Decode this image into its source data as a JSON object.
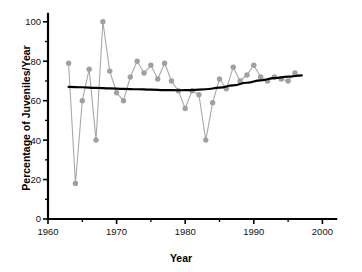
{
  "chart_data": {
    "type": "line",
    "title": "",
    "xlabel": "Year",
    "ylabel": "Percentage of Juveniles/Year",
    "xlim": [
      1960,
      2002
    ],
    "ylim": [
      0,
      104
    ],
    "xticks": [
      1960,
      1970,
      1980,
      1990,
      2000
    ],
    "xtick_labels": [
      "1960",
      "1970",
      "1980",
      "1990",
      "2000"
    ],
    "xticks_minor": [
      1965,
      1975,
      1985,
      1995
    ],
    "yticks": [
      0,
      20,
      40,
      60,
      80,
      100
    ],
    "ytick_labels": [
      "0",
      "20",
      "40",
      "60",
      "80",
      "100"
    ],
    "yticks_minor": [
      10,
      30,
      50,
      70,
      90
    ],
    "grid": false,
    "legend": "none",
    "series": [
      {
        "name": "Percentage of Juveniles",
        "marker": "circle",
        "color": "#a0a0a0",
        "x": [
          1963,
          1964,
          1965,
          1966,
          1967,
          1968,
          1969,
          1970,
          1971,
          1972,
          1973,
          1974,
          1975,
          1976,
          1977,
          1978,
          1979,
          1980,
          1981,
          1982,
          1983,
          1984,
          1985,
          1986,
          1987,
          1988,
          1989,
          1990,
          1991,
          1992,
          1993,
          1994,
          1995,
          1996
        ],
        "values": [
          79,
          18,
          60,
          76,
          40,
          100,
          75,
          64,
          60,
          72,
          80,
          74,
          78,
          71,
          79,
          70,
          65,
          56,
          65,
          63,
          40,
          59,
          71,
          66,
          77,
          70,
          73,
          78,
          72,
          70,
          72,
          71,
          70,
          74
        ]
      },
      {
        "name": "Trend (quadratic fit)",
        "marker": "none",
        "color": "#000000",
        "x": [
          1963,
          1965,
          1967,
          1969,
          1971,
          1973,
          1975,
          1977,
          1979,
          1981,
          1983,
          1985,
          1987,
          1989,
          1991,
          1993,
          1995,
          1997
        ],
        "values": [
          67.0,
          66.8,
          66.5,
          66.2,
          66.0,
          65.8,
          65.6,
          65.4,
          65.3,
          65.4,
          65.8,
          66.6,
          67.8,
          69.1,
          70.3,
          71.4,
          72.2,
          72.8
        ]
      }
    ]
  }
}
